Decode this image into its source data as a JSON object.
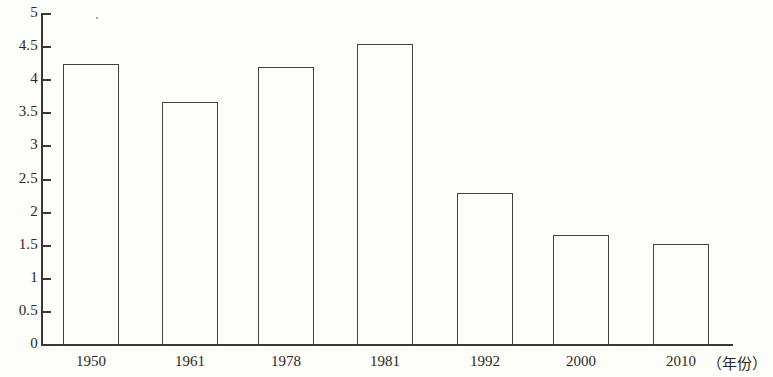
{
  "chart_data": {
    "type": "bar",
    "title": "",
    "subtitle": "",
    "xlabel": "（年份）",
    "ylabel": "",
    "categories": [
      "1950",
      "1961",
      "1978",
      "1981",
      "1992",
      "2000",
      "2010"
    ],
    "values": [
      4.25,
      3.67,
      4.2,
      4.55,
      2.3,
      1.66,
      1.52
    ],
    "series": [
      {
        "name": "",
        "values": [
          4.25,
          3.67,
          4.2,
          4.55,
          2.3,
          1.66,
          1.52
        ]
      }
    ],
    "ylim": [
      0,
      5
    ],
    "xlim": null,
    "y_ticks": [
      "0",
      "0.5",
      "1",
      "1.5",
      "2",
      "2.5",
      "3",
      "3.5",
      "4",
      "4.5",
      "5"
    ],
    "y_tick_values": [
      0,
      0.5,
      1,
      1.5,
      2,
      2.5,
      3,
      3.5,
      4,
      4.5,
      5
    ],
    "grid": false,
    "legend": false,
    "legend_position": "none",
    "bar_fill": "#ffffff",
    "bar_edge_color": "#46423c",
    "axis_color": "#3a3733",
    "background_color": "#fdfdfa",
    "annotations": []
  },
  "axis": {
    "unit_label": "（年份）"
  }
}
